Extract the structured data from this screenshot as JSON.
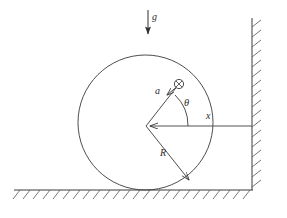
{
  "figure": {
    "kind": "physics-free-body-diagram",
    "background_color": "#ffffff",
    "stroke_color": "#3a3a3a",
    "label_color": "#2b2b2b"
  },
  "labels": {
    "gravity": "g",
    "offset": "a",
    "angle": "θ",
    "horizontal_distance": "x",
    "radius": "R"
  },
  "geometry": {
    "circle": {
      "cx": 145.5,
      "cy": 122.5,
      "r": 67.5
    },
    "center_point": {
      "x": 146,
      "y": 126
    },
    "mass_marker": {
      "x": 179,
      "y": 84,
      "r": 4.5,
      "symbol": "circle-with-cross"
    },
    "gravity_arrow": {
      "x": 148,
      "y1": 10,
      "y2": 38
    },
    "radius_arrow": {
      "x1": 146,
      "y1": 126,
      "x2": 190,
      "y2": 181
    },
    "offset_arrow": {
      "x1": 179,
      "y1": 84,
      "x2": 150,
      "y2": 121
    },
    "x_line": {
      "x1": 146,
      "y1": 126,
      "x2": 252,
      "y2": 126
    },
    "angle_arc_radius": 42,
    "wall": {
      "x": 252,
      "y1": 18,
      "y2": 190
    },
    "ground": {
      "y": 190,
      "x1": 14,
      "x2": 253
    }
  },
  "label_positions": {
    "gravity": {
      "x": 152,
      "y": 13
    },
    "offset": {
      "x": 155,
      "y": 91
    },
    "angle": {
      "x": 184,
      "y": 102
    },
    "horizontal_distance": {
      "x": 206,
      "y": 115
    },
    "radius": {
      "x": 160,
      "y": 153
    }
  }
}
